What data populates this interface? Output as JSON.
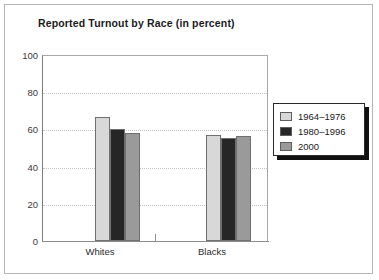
{
  "chart_data": {
    "type": "bar",
    "title": "Reported Turnout by Race (in percent)",
    "xlabel": "",
    "ylabel": "",
    "ylim": [
      0,
      100
    ],
    "yticks": [
      0,
      20,
      40,
      60,
      80,
      100
    ],
    "grid": true,
    "legend_position": "right",
    "categories": [
      "Whites",
      "Blacks"
    ],
    "series": [
      {
        "name": "1964–1976",
        "color": "#d8d8d8",
        "values": [
          66.7,
          57.0
        ]
      },
      {
        "name": "1980–1996",
        "color": "#262626",
        "values": [
          60.0,
          55.5
        ]
      },
      {
        "name": "2000",
        "color": "#9a9a9a",
        "values": [
          58.0,
          56.5
        ]
      }
    ]
  },
  "axis": {
    "ytick_labels": [
      "100",
      "80",
      "60",
      "40",
      "20",
      "0"
    ]
  },
  "legend": {
    "entries": [
      {
        "label": "1964–1976"
      },
      {
        "label": "1980–1996"
      },
      {
        "label": "2000"
      }
    ]
  }
}
